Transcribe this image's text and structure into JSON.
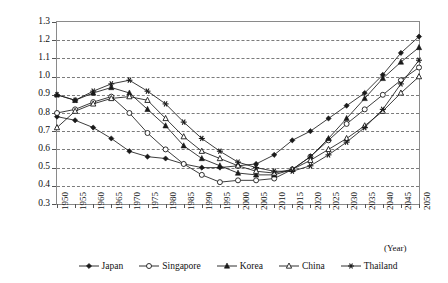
{
  "chart_data": {
    "type": "line",
    "title": "",
    "xlabel": "(Year)",
    "ylabel": "Dependency ratio of population",
    "ylim": [
      0.3,
      1.3
    ],
    "ytick_step": 0.1,
    "grid": true,
    "legend_position": "bottom",
    "x": [
      1950,
      1955,
      1960,
      1965,
      1970,
      1975,
      1980,
      1985,
      1990,
      1995,
      2000,
      2005,
      2010,
      2015,
      2020,
      2025,
      2030,
      2035,
      2040,
      2045,
      2050
    ],
    "xtick_labels": [
      "1950",
      "1955",
      "1960",
      "1965",
      "1970",
      "1975",
      "1980",
      "1985",
      "1990",
      "1995",
      "2000",
      "2005",
      "2010",
      "2015",
      "2020",
      "2025",
      "2030",
      "2035",
      "2040",
      "2045",
      "2050"
    ],
    "ytick_labels": [
      "0.3",
      "0.4",
      "0.5",
      "0.6",
      "0.7",
      "0.8",
      "0.9",
      "1.0",
      "1.1",
      "1.2",
      "1.3"
    ],
    "series": [
      {
        "name": "Japan",
        "marker": "filled-diamond",
        "values": [
          0.78,
          0.76,
          0.72,
          0.66,
          0.59,
          0.56,
          0.55,
          0.52,
          0.5,
          0.5,
          0.51,
          0.52,
          0.57,
          0.65,
          0.7,
          0.77,
          0.84,
          0.91,
          1.01,
          1.13,
          1.22
        ]
      },
      {
        "name": "Singapore",
        "marker": "open-circle",
        "values": [
          0.8,
          0.82,
          0.86,
          0.89,
          0.8,
          0.69,
          0.6,
          0.52,
          0.46,
          0.42,
          0.43,
          0.43,
          0.44,
          0.49,
          0.56,
          0.65,
          0.74,
          0.82,
          0.9,
          0.98,
          1.05
        ]
      },
      {
        "name": "Korea",
        "marker": "filled-triangle",
        "values": [
          0.9,
          0.87,
          0.91,
          0.94,
          0.91,
          0.82,
          0.73,
          0.62,
          0.55,
          0.51,
          0.47,
          0.46,
          0.46,
          0.49,
          0.56,
          0.66,
          0.77,
          0.88,
          0.99,
          1.08,
          1.16
        ]
      },
      {
        "name": "China",
        "marker": "open-triangle",
        "values": [
          0.72,
          0.81,
          0.85,
          0.88,
          0.89,
          0.87,
          0.77,
          0.67,
          0.59,
          0.55,
          0.51,
          0.48,
          0.47,
          0.49,
          0.54,
          0.6,
          0.66,
          0.73,
          0.81,
          0.91,
          1.0
        ]
      },
      {
        "name": "Thailand",
        "marker": "star",
        "values": [
          0.9,
          0.87,
          0.92,
          0.96,
          0.98,
          0.92,
          0.85,
          0.75,
          0.66,
          0.59,
          0.53,
          0.5,
          0.48,
          0.48,
          0.51,
          0.57,
          0.64,
          0.72,
          0.82,
          0.96,
          1.09
        ]
      }
    ]
  },
  "legend": {
    "items": [
      {
        "label": "Japan"
      },
      {
        "label": "Singapore"
      },
      {
        "label": "Korea"
      },
      {
        "label": "China"
      },
      {
        "label": "Thailand"
      }
    ]
  },
  "axis": {
    "y_title": "Dependency ratio of population",
    "x_unit": "(Year)"
  }
}
